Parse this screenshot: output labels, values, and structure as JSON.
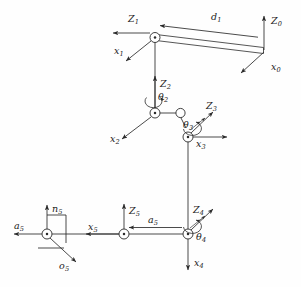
{
  "figure": {
    "kind": "robot-kinematic-frame-diagram",
    "background_color": "#fefefe",
    "line_color": "#2b2b2b",
    "text_color": "#1a1a1a",
    "width": 301,
    "height": 287
  },
  "labels": {
    "z1": "Z",
    "z1_sub": "1",
    "x1": "x",
    "x1_sub": "1",
    "d1": "d",
    "d1_sub": "1",
    "z0": "Z",
    "z0_sub": "0",
    "x0": "x",
    "x0_sub": "0",
    "z2": "Z",
    "z2_sub": "2",
    "th2": "θ",
    "th2_sub": "2",
    "x2": "x",
    "x2_sub": "2",
    "z3": "Z",
    "z3_sub": "3",
    "th3": "θ",
    "th3_sub": "3",
    "x3": "x",
    "x3_sub": "3",
    "z4": "Z",
    "z4_sub": "4",
    "th4": "θ",
    "th4_sub": "4",
    "x4": "x",
    "x4_sub": "4",
    "z5": "Z",
    "z5_sub": "5",
    "x5": "x",
    "x5_sub": "5",
    "a5": "a",
    "a5_sub": "5",
    "n5": "n",
    "n5_sub": "5",
    "a5e": "a",
    "a5e_sub": "5",
    "o5": "o",
    "o5_sub": "5"
  },
  "frames": [
    {
      "name": "frame-0",
      "origin": [
        264,
        47
      ],
      "axes": [
        "Z0",
        "x0"
      ]
    },
    {
      "name": "frame-1",
      "origin": [
        155,
        39
      ],
      "axes": [
        "Z1",
        "x1"
      ]
    },
    {
      "name": "frame-2",
      "origin": [
        155,
        113
      ],
      "axes": [
        "Z2",
        "x2"
      ],
      "joint_var": "θ2"
    },
    {
      "name": "frame-3",
      "origin": [
        188,
        137
      ],
      "axes": [
        "Z3",
        "x3"
      ],
      "joint_var": "θ3"
    },
    {
      "name": "frame-4",
      "origin": [
        188,
        234
      ],
      "axes": [
        "Z4",
        "x4"
      ],
      "joint_var": "θ4"
    },
    {
      "name": "frame-5",
      "origin": [
        124,
        234
      ],
      "axes": [
        "Z5",
        "x5"
      ]
    },
    {
      "name": "frame-tool",
      "origin": [
        47,
        234
      ],
      "axes": [
        "n5",
        "a5",
        "o5"
      ]
    }
  ],
  "links": [
    {
      "name": "link-d1",
      "from": [
        155,
        39
      ],
      "to": [
        264,
        52
      ],
      "label": "d1"
    },
    {
      "name": "link-1-2",
      "from": [
        155,
        39
      ],
      "to": [
        155,
        113
      ]
    },
    {
      "name": "link-2-3",
      "from": [
        155,
        113
      ],
      "to": [
        188,
        120
      ]
    },
    {
      "name": "link-3-4",
      "from": [
        188,
        137
      ],
      "to": [
        188,
        234
      ]
    },
    {
      "name": "link-a5",
      "from": [
        188,
        234
      ],
      "to": [
        124,
        234
      ],
      "label": "a5"
    },
    {
      "name": "link-5-tool",
      "from": [
        124,
        234
      ],
      "to": [
        47,
        234
      ]
    }
  ]
}
